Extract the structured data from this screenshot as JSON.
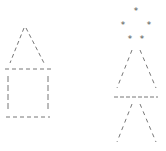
{
  "figure": {
    "stroke_color": "#777777",
    "star_color": "#555555",
    "star_glyph": "*",
    "house": {
      "roof": {
        "peak": [
          25,
          28
        ],
        "left_base": [
          10,
          63
        ],
        "right_base": [
          44,
          63
        ]
      },
      "top_line": {
        "x1": 5,
        "x2": 52,
        "y": 69
      },
      "left_wall": {
        "x": 8,
        "y1": 76,
        "y2": 112
      },
      "right_wall": {
        "x": 48,
        "y1": 76,
        "y2": 112
      },
      "bottom_line": {
        "x1": 6,
        "x2": 50,
        "y": 117
      }
    },
    "tree": {
      "stars": [
        [
          136,
          10
        ],
        [
          123,
          24
        ],
        [
          149,
          24
        ],
        [
          130,
          38
        ],
        [
          142,
          38
        ]
      ],
      "upper_left_slant": [
        [
          132,
          50
        ],
        [
          117,
          88
        ]
      ],
      "upper_right_slant": [
        [
          140,
          50
        ],
        [
          156,
          88
        ]
      ],
      "middle_line": {
        "x1": 114,
        "x2": 158,
        "y": 97
      },
      "lower_left_slant": [
        [
          132,
          104
        ],
        [
          117,
          142
        ]
      ],
      "lower_right_slant": [
        [
          140,
          104
        ],
        [
          156,
          142
        ]
      ]
    }
  }
}
